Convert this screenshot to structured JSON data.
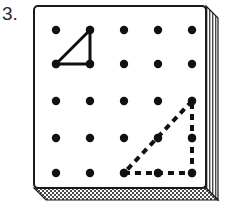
{
  "label": {
    "number": "3."
  },
  "board": {
    "name": "geoboard",
    "rows": 4,
    "columns": 5,
    "peg_color": "#111111",
    "frame_color": "#1a1a1a",
    "frame_fill": "#ffffff",
    "shadow_pattern": "hatched",
    "peg_grid": [
      [
        {
          "row": 0,
          "col": 0,
          "x": 24,
          "y": 26
        },
        {
          "row": 0,
          "col": 1,
          "x": 58,
          "y": 26
        },
        {
          "row": 0,
          "col": 2,
          "x": 92,
          "y": 26
        },
        {
          "row": 0,
          "col": 3,
          "x": 126,
          "y": 26
        },
        {
          "row": 0,
          "col": 4,
          "x": 160,
          "y": 26
        }
      ],
      [
        {
          "row": 1,
          "col": 0,
          "x": 24,
          "y": 60
        },
        {
          "row": 1,
          "col": 1,
          "x": 58,
          "y": 60
        },
        {
          "row": 1,
          "col": 2,
          "x": 92,
          "y": 60
        },
        {
          "row": 1,
          "col": 3,
          "x": 126,
          "y": 60
        },
        {
          "row": 1,
          "col": 4,
          "x": 160,
          "y": 60
        }
      ],
      [
        {
          "row": 2,
          "col": 0,
          "x": 24,
          "y": 97
        },
        {
          "row": 2,
          "col": 1,
          "x": 58,
          "y": 97
        },
        {
          "row": 2,
          "col": 2,
          "x": 92,
          "y": 97
        },
        {
          "row": 2,
          "col": 3,
          "x": 126,
          "y": 97
        },
        {
          "row": 2,
          "col": 4,
          "x": 160,
          "y": 97
        }
      ],
      [
        {
          "row": 3,
          "col": 0,
          "x": 24,
          "y": 134
        },
        {
          "row": 3,
          "col": 1,
          "x": 58,
          "y": 134
        },
        {
          "row": 3,
          "col": 2,
          "x": 92,
          "y": 134
        },
        {
          "row": 3,
          "col": 3,
          "x": 126,
          "y": 134
        },
        {
          "row": 3,
          "col": 4,
          "x": 160,
          "y": 134
        }
      ],
      [
        {
          "row": 4,
          "col": 0,
          "x": 24,
          "y": 169
        },
        {
          "row": 4,
          "col": 1,
          "x": 58,
          "y": 169
        },
        {
          "row": 4,
          "col": 2,
          "x": 92,
          "y": 169
        },
        {
          "row": 4,
          "col": 3,
          "x": 126,
          "y": 169
        },
        {
          "row": 4,
          "col": 4,
          "x": 160,
          "y": 169
        }
      ]
    ]
  },
  "shapes": {
    "solid_triangle": {
      "name": "solid-triangle",
      "style": "solid",
      "stroke_color": "#111111",
      "stroke_width": 3,
      "vertices": [
        {
          "label": "top-right",
          "peg_row": 0,
          "peg_col": 1,
          "x": 58,
          "y": 26
        },
        {
          "label": "bottom-left",
          "peg_row": 1,
          "peg_col": 0,
          "x": 24,
          "y": 60
        },
        {
          "label": "bottom-right",
          "peg_row": 1,
          "peg_col": 1,
          "x": 58,
          "y": 60
        }
      ]
    },
    "dashed_triangle": {
      "name": "dashed-triangle",
      "style": "dashed",
      "stroke_color": "#111111",
      "stroke_width": 4,
      "dash_pattern": "6 5",
      "vertices": [
        {
          "label": "top-right",
          "peg_row": 2,
          "peg_col": 4,
          "x": 160,
          "y": 97
        },
        {
          "label": "bottom-left",
          "peg_row": 4,
          "peg_col": 2,
          "x": 92,
          "y": 169
        },
        {
          "label": "bottom-right",
          "peg_row": 4,
          "peg_col": 4,
          "x": 160,
          "y": 169
        }
      ]
    }
  }
}
